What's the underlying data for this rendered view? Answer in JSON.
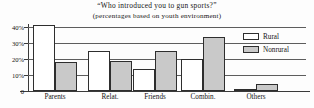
{
  "chart_data": {
    "type": "bar",
    "title": "“Who introduced you to gun sports?”",
    "subtitle": "(percentages based on youth environment)",
    "xlabel": "",
    "ylabel": "",
    "ylim": [
      0,
      44
    ],
    "grid": true,
    "legend_position": "right",
    "categories": [
      "Parents",
      "Relat.",
      "Friends",
      "Combin.",
      "Others"
    ],
    "series": [
      {
        "name": "Rural",
        "color": "#ffffff",
        "values": [
          41,
          25,
          13.5,
          20,
          1
        ]
      },
      {
        "name": "Nonrural",
        "color": "#c9c9c9",
        "values": [
          18,
          19,
          25,
          34,
          4.5
        ]
      }
    ],
    "ticks": [
      {
        "label": "40%",
        "value": 40
      },
      {
        "label": "30%",
        "value": 30
      },
      {
        "label": "20%",
        "value": 20
      },
      {
        "label": "10%",
        "value": 10
      },
      {
        "label": "0",
        "value": 0
      }
    ]
  }
}
